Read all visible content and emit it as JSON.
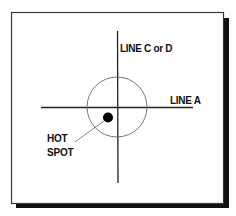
{
  "diagram": {
    "labels": {
      "line_cd": "LINE C or D",
      "line_a": "LINE A",
      "hot": "HOT",
      "spot": "SPOT"
    },
    "colors": {
      "background": "#ffffff",
      "frame": "#3a3a3a",
      "shadow": "#111111",
      "lines": "#222222",
      "circle": "#666666",
      "hot_spot": "#000000"
    }
  }
}
